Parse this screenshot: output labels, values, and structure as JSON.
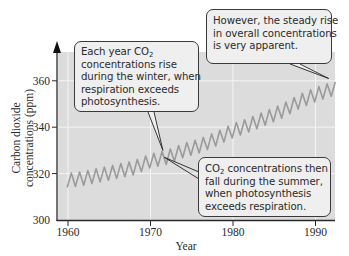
{
  "chart_data": {
    "type": "line",
    "title": "",
    "xlabel": "Year",
    "ylabel": "Carbon dioxide concentrations (ppm)",
    "ylabel_lines": [
      "Carbon dioxide",
      "concentrations (ppm)"
    ],
    "xlim": [
      1958.8,
      1993
    ],
    "ylim": [
      300,
      370
    ],
    "x_ticks": [
      1960,
      1970,
      1980,
      1990
    ],
    "y_ticks": [
      300,
      320,
      340,
      360
    ],
    "grid": true,
    "legend": null,
    "series": [
      {
        "name": "Atmospheric CO2 (Mauna Loa)",
        "description": "Sawtooth seasonal oscillation (~±3 ppm) superimposed on a steady rise",
        "x": [
          1960,
          1962,
          1964,
          1966,
          1968,
          1970,
          1972,
          1974,
          1976,
          1978,
          1980,
          1982,
          1984,
          1986,
          1988,
          1990,
          1992
        ],
        "values": [
          317,
          318,
          319.5,
          321,
          322.5,
          325.5,
          327,
          330,
          332,
          335,
          338.5,
          341,
          344,
          347,
          351,
          354,
          356.5
        ],
        "seasonal_amplitude": 6
      }
    ],
    "annotations": [
      {
        "id": "winter",
        "lines": [
          "Each year CO2",
          "concentrations rise",
          "during the winter, when",
          "respiration exceeds",
          "photosynthesis."
        ],
        "points_to": {
          "x": 1971.5,
          "y": 331
        }
      },
      {
        "id": "trend",
        "lines": [
          "However, the steady rise",
          "in overall concentrations",
          "is very apparent."
        ],
        "points_to": {
          "x": 1991.5,
          "y": 362
        }
      },
      {
        "id": "summer",
        "lines": [
          "CO2 concentrations then",
          "fall during the summer,",
          "when photosynthesis",
          "exceeds respiration."
        ],
        "points_to": {
          "x": 1971.8,
          "y": 327
        }
      }
    ]
  },
  "colors": {
    "plot_bg": "#dcdcdc",
    "line": "#9a9a9a",
    "grid": "#f4f4f4",
    "axis": "#2a2a2a",
    "callout_bg": "#efefef"
  },
  "callouts": {
    "winter": {
      "l1_pre": "Each year CO",
      "l1_sub": "2",
      "l2": "concentrations rise",
      "l3": "during the winter, when",
      "l4": "respiration exceeds",
      "l5": "photosynthesis."
    },
    "trend": {
      "l1": "However, the steady rise",
      "l2": "in overall concentrations",
      "l3": "is very apparent."
    },
    "summer": {
      "l1_pre": "CO",
      "l1_sub": "2",
      "l1_post": " concentrations then",
      "l2": "fall during the summer,",
      "l3": "when photosynthesis",
      "l4": "exceeds respiration."
    }
  }
}
